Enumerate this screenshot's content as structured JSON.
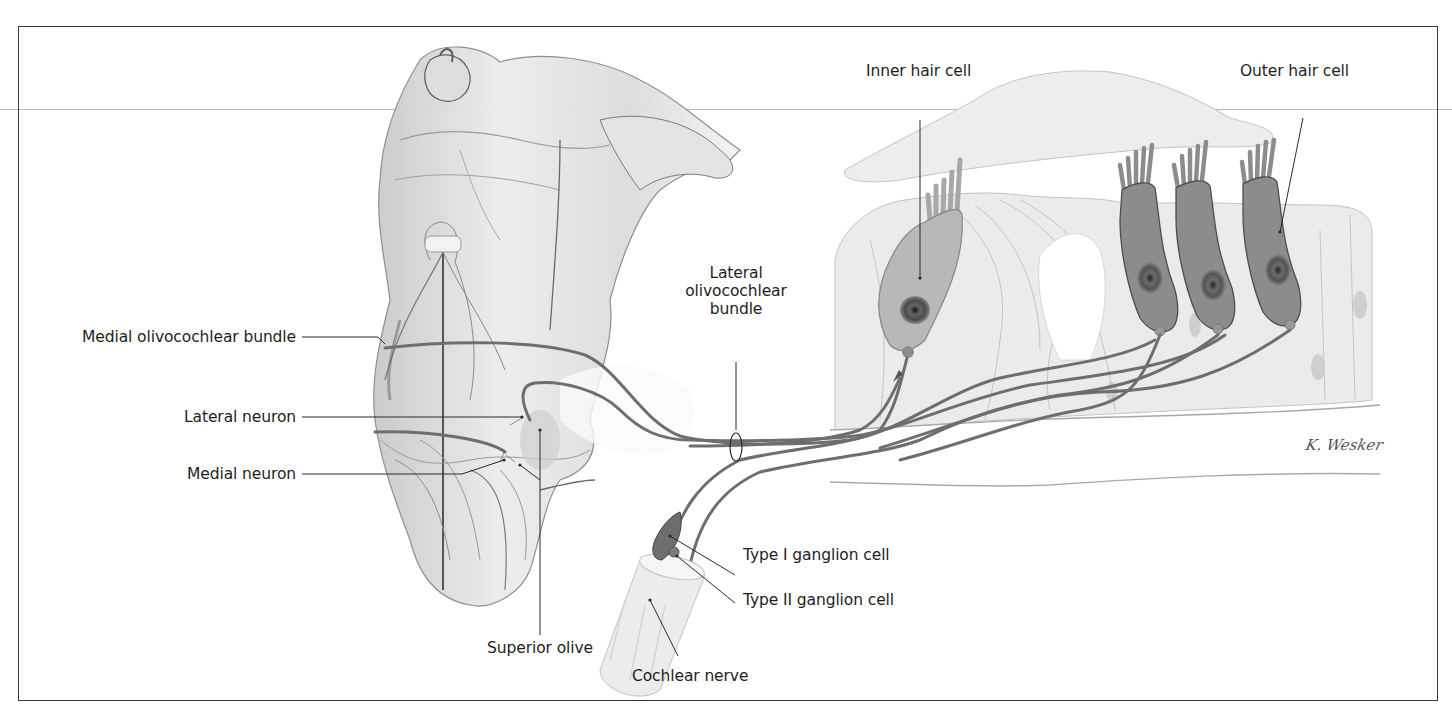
{
  "figure": {
    "signature": "K. Wesker",
    "colors": {
      "frame": "#3a3a3a",
      "label_text": "#1e1e1e",
      "leader_line": "#2a2a2a",
      "nerve_fiber": "#6e6e6e",
      "outer_hair_cell": "#8c8c8c",
      "inner_hair_cell": "#b8b8b8",
      "supporting_cells": "#e6e6e6",
      "tectorial_membrane": "#ececec",
      "brainstem": "#d6d6d6"
    }
  },
  "labels": {
    "medial_olivocochlear_bundle": "Medial olivocochlear bundle",
    "lateral_neuron": "Lateral neuron",
    "medial_neuron": "Medial neuron",
    "superior_olive": "Superior olive",
    "lateral_olivocochlear_bundle": [
      "Lateral",
      "olivocochlear",
      "bundle"
    ],
    "inner_hair_cell": "Inner hair cell",
    "outer_hair_cell": "Outer hair cell",
    "type_i_ganglion_cell": "Type I ganglion cell",
    "type_ii_ganglion_cell": "Type II ganglion cell",
    "cochlear_nerve": "Cochlear nerve"
  }
}
